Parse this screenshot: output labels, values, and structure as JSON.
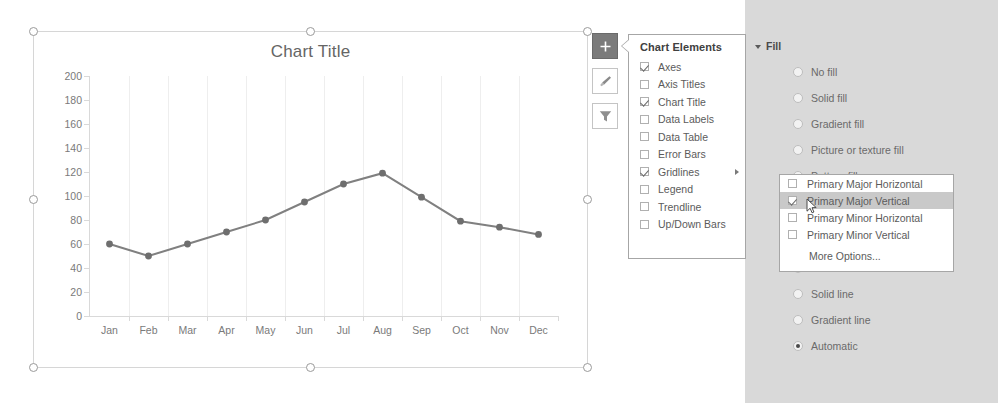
{
  "chart_data": {
    "type": "line",
    "title": "Chart Title",
    "categories": [
      "Jan",
      "Feb",
      "Mar",
      "Apr",
      "May",
      "Jun",
      "Jul",
      "Aug",
      "Sep",
      "Oct",
      "Nov",
      "Dec"
    ],
    "values": [
      60,
      50,
      60,
      70,
      80,
      95,
      110,
      119,
      99,
      79,
      74,
      68
    ],
    "yticks": [
      200,
      180,
      160,
      140,
      120,
      100,
      80,
      60,
      40,
      20,
      0
    ],
    "ylim": [
      0,
      200
    ],
    "xlabel": "",
    "ylabel": "",
    "grid": "vertical-major",
    "legend": "none",
    "series_color": "#808080",
    "marker_color": "#6e6e6e",
    "gridline_color": "#eeeeee"
  },
  "chart_buttons": [
    {
      "name": "chart-elements",
      "icon": "plus-icon",
      "active": true
    },
    {
      "name": "chart-styles",
      "icon": "brush-icon",
      "active": false
    },
    {
      "name": "chart-filters",
      "icon": "funnel-icon",
      "active": false
    }
  ],
  "chart_elements_menu": {
    "header": "Chart Elements",
    "items": [
      {
        "label": "Axes",
        "checked": true,
        "submenu": false
      },
      {
        "label": "Axis Titles",
        "checked": false,
        "submenu": false
      },
      {
        "label": "Chart Title",
        "checked": true,
        "submenu": false
      },
      {
        "label": "Data Labels",
        "checked": false,
        "submenu": false
      },
      {
        "label": "Data Table",
        "checked": false,
        "submenu": false
      },
      {
        "label": "Error Bars",
        "checked": false,
        "submenu": false
      },
      {
        "label": "Gridlines",
        "checked": true,
        "submenu": true
      },
      {
        "label": "Legend",
        "checked": false,
        "submenu": false
      },
      {
        "label": "Trendline",
        "checked": false,
        "submenu": false
      },
      {
        "label": "Up/Down Bars",
        "checked": false,
        "submenu": false
      }
    ]
  },
  "gridlines_submenu": {
    "items": [
      {
        "label": "Primary Major Horizontal",
        "checked": false,
        "highlighted": false
      },
      {
        "label": "Primary Major Vertical",
        "checked": true,
        "highlighted": true
      },
      {
        "label": "Primary Minor Horizontal",
        "checked": false,
        "highlighted": false
      },
      {
        "label": "Primary Minor Vertical",
        "checked": false,
        "highlighted": false
      }
    ],
    "more_options": "More Options..."
  },
  "format_pane": {
    "fill_section": {
      "header": "Fill",
      "options": [
        {
          "label": "No fill",
          "accel": "N",
          "rest": "o fill",
          "selected": false
        },
        {
          "label": "Solid fill",
          "accel": "S",
          "rest": "olid fill",
          "selected": false
        },
        {
          "label": "Gradient fill",
          "accel": "G",
          "rest": "radient fill",
          "selected": false
        },
        {
          "label": "Picture or texture fill",
          "accel": "P",
          "rest": "icture or texture fill",
          "selected": false
        },
        {
          "label": "Pattern fill",
          "accel": "a",
          "rest": "ttern fill",
          "pre": "P",
          "selected": false
        }
      ]
    },
    "line_section": {
      "options": [
        {
          "label": "No line",
          "accel": "N",
          "rest": "o line",
          "selected": false
        },
        {
          "label": "Solid line",
          "accel": "S",
          "rest": "olid line",
          "selected": false
        },
        {
          "label": "Gradient line",
          "accel": "G",
          "rest": "radient line",
          "selected": false
        },
        {
          "label": "Automatic",
          "accel": "u",
          "pre": "A",
          "rest": "tomatic",
          "selected": true
        }
      ]
    }
  },
  "colors": {
    "pane_bg": "#d9d9d9",
    "menu_bg": "#ffffff",
    "highlight": "#c9c9c9",
    "text": "#5b5b5b",
    "series": "#808080"
  }
}
